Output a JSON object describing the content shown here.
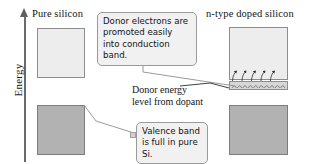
{
  "figure": {
    "axis": {
      "label": "Energy",
      "arrow_icon": "up-arrow-icon"
    },
    "columns": [
      {
        "id": "left",
        "title": "Pure silicon"
      },
      {
        "id": "right",
        "title": "n-type doped silicon"
      }
    ],
    "bands": [
      {
        "id": "cb-left",
        "name": "conduction-band-pure",
        "type": "conduction"
      },
      {
        "id": "vb-left",
        "name": "valence-band-pure",
        "type": "valence"
      },
      {
        "id": "cb-right",
        "name": "conduction-band-doped",
        "type": "conduction"
      },
      {
        "id": "vb-right",
        "name": "valence-band-doped",
        "type": "valence"
      }
    ],
    "donor_level": {
      "label": "Donor energy\nlevel from dopant",
      "label_line1": "Donor energy",
      "label_line2": "level from dopant",
      "electron_count": 10,
      "promotion_arrow_count": 5
    },
    "callouts": [
      {
        "id": "donor",
        "name": "callout-donor-electrons",
        "text": "Donor electrons are promoted easily into conduction band."
      },
      {
        "id": "valence",
        "name": "callout-valence-band",
        "text": "Valence band is full in pure Si."
      }
    ],
    "colors": {
      "conduction_fill": "#ededed",
      "valence_fill": "#b2b2b2",
      "donor_fill": "#d7d7d7",
      "callout_fill": "#f1f1f1",
      "border": "#8d8d8d",
      "axis": "#6a6a6a",
      "text": "#141414",
      "background": "#ffffff"
    }
  }
}
